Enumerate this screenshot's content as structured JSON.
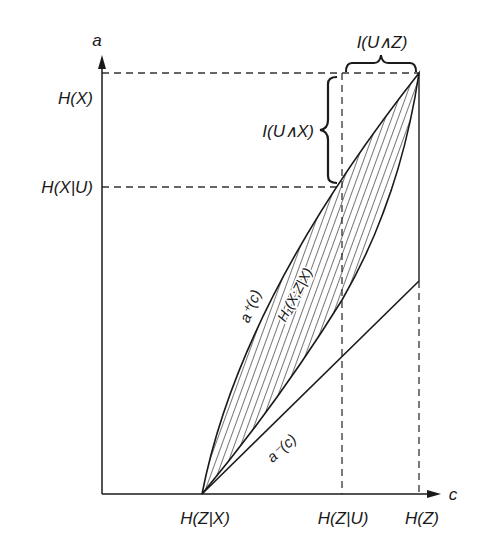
{
  "diagram": {
    "axes": {
      "y_label": "a",
      "x_label": "c"
    },
    "y_ticks": [
      {
        "label": "H(X)",
        "y": 73
      },
      {
        "label": "H(X|U)",
        "y": 187
      }
    ],
    "x_ticks": [
      {
        "label": "H(Z|X)",
        "x": 202
      },
      {
        "label": "H(Z|U)",
        "x": 342
      },
      {
        "label": "H(Z)",
        "x": 419
      }
    ],
    "braces": {
      "horizontal": "I(U∧Z)",
      "vertical": "I(U∧X)"
    },
    "curves": {
      "upper": "a⁺(c)",
      "lower": "a⁻(c)",
      "region": "H₁(X;Z|X)"
    },
    "colors": {
      "ink": "#1a1a1a",
      "background": "#ffffff"
    }
  }
}
